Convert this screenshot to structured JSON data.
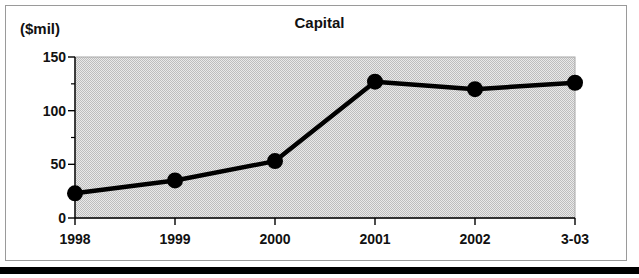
{
  "figure": {
    "unit_label": "($mil)",
    "bottom_bar_color": "#000000",
    "frame_color": "#9a9a9a",
    "plot_background": "#d9d9d9",
    "series_color": "#000000"
  },
  "chart_data": {
    "type": "line",
    "title": "Capital",
    "xlabel": "",
    "ylabel": "($mil)",
    "categories": [
      "1998",
      "1999",
      "2000",
      "2001",
      "2002",
      "3-03"
    ],
    "values": [
      23,
      35,
      53,
      127,
      120,
      126
    ],
    "ylim": [
      0,
      150
    ],
    "yticks": [
      0,
      50,
      100,
      150
    ],
    "ytick_labels": [
      "0",
      "50",
      "100",
      "150"
    ],
    "yminorticks": [
      25,
      75,
      125
    ],
    "grid": false,
    "legend": false,
    "marker": "filled-circle",
    "line_width": 4
  }
}
